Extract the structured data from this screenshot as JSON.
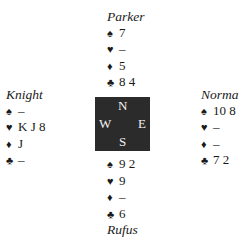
{
  "hands": {
    "north": {
      "name": "Parker",
      "spades": "7",
      "hearts": "–",
      "diamonds": "5",
      "clubs": "8 4"
    },
    "west": {
      "name": "Knight",
      "spades": "–",
      "hearts": "K J 8",
      "diamonds": "J",
      "clubs": "–"
    },
    "east": {
      "name": "Norma",
      "spades": "10 8",
      "hearts": "–",
      "diamonds": "–",
      "clubs": "7 2"
    },
    "south": {
      "name": "Rufus",
      "spades": "9 2",
      "hearts": "9",
      "diamonds": "–",
      "clubs": "6"
    }
  },
  "suits": {
    "spades": "♠",
    "hearts": "♥",
    "diamonds": "♦",
    "clubs": "♣"
  },
  "compass": {
    "n": "N",
    "s": "S",
    "e": "E",
    "w": "W",
    "bg": "#2b2b2b"
  }
}
